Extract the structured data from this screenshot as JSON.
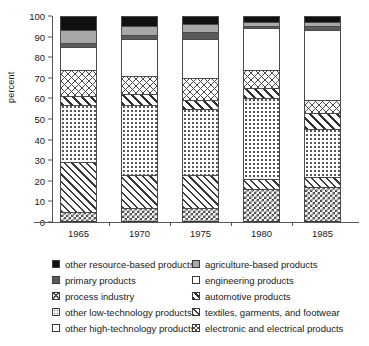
{
  "chart_data": {
    "type": "bar",
    "title": "",
    "subtitle": "",
    "xlabel": "",
    "ylabel": "percent",
    "ylim": [
      0,
      100
    ],
    "yticks": [
      0,
      10,
      20,
      30,
      40,
      50,
      60,
      70,
      80,
      90,
      100
    ],
    "grid": false,
    "stacked": true,
    "stack_total": 100,
    "legend_position": "below",
    "categories": [
      "1965",
      "1970",
      "1975",
      "1980",
      "1985"
    ],
    "series": [
      {
        "name": "electronic and electrical products",
        "pattern": "checkerboard",
        "values": [
          5,
          7,
          7,
          16,
          17
        ]
      },
      {
        "name": "textiles, garments, and footwear",
        "pattern": "thin-diagonal",
        "values": [
          24,
          16,
          16,
          5,
          5
        ]
      },
      {
        "name": "other low-technology products",
        "pattern": "fine-dots",
        "values": [
          28,
          34,
          32,
          39,
          23
        ]
      },
      {
        "name": "automotive products",
        "pattern": "bold-diagonal",
        "values": [
          4,
          5,
          4,
          5,
          8
        ]
      },
      {
        "name": "process industry",
        "pattern": "cross-hatch",
        "values": [
          13,
          9,
          11,
          9,
          6
        ]
      },
      {
        "name": "engineering products",
        "pattern": "white",
        "values": [
          11,
          18,
          19,
          20,
          34
        ]
      },
      {
        "name": "primary products",
        "pattern": "dark-gray",
        "values": [
          2,
          2,
          3,
          1,
          2
        ]
      },
      {
        "name": "agriculture-based products",
        "pattern": "gray",
        "values": [
          6,
          4,
          4,
          2,
          2
        ]
      },
      {
        "name": "other resource-based products",
        "pattern": "black",
        "values": [
          7,
          5,
          4,
          3,
          3
        ]
      }
    ]
  },
  "legend": {
    "left_column": [
      {
        "label": "other resource-based products",
        "swatch": "black"
      },
      {
        "label": "primary products",
        "swatch": "dark-gray"
      },
      {
        "label": "process industry",
        "swatch": "cross-hatch"
      },
      {
        "label": "other low-technology products",
        "swatch": "fine-dots"
      },
      {
        "label": "other high-technology products",
        "swatch": "white"
      }
    ],
    "right_column": [
      {
        "label": "agriculture-based products",
        "swatch": "gray"
      },
      {
        "label": "engineering products",
        "swatch": "white"
      },
      {
        "label": "automotive products",
        "swatch": "bold-diagonal"
      },
      {
        "label": "textiles, garments, and footwear",
        "swatch": "thin-diagonal"
      },
      {
        "label": "electronic and electrical products",
        "swatch": "checkerboard"
      }
    ]
  }
}
